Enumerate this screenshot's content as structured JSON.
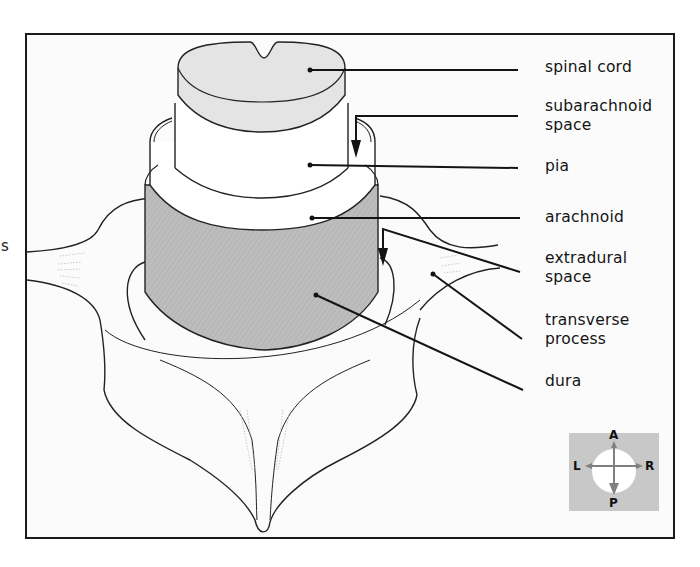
{
  "figure": {
    "type": "anatomical-diagram",
    "edge_fragment": "s"
  },
  "labels": [
    {
      "id": "spinal-cord",
      "text": "spinal cord"
    },
    {
      "id": "subarachnoid-space",
      "text": "subarachnoid\nspace"
    },
    {
      "id": "pia",
      "text": "pia"
    },
    {
      "id": "arachnoid",
      "text": "arachnoid"
    },
    {
      "id": "extradural-space",
      "text": "extradural\nspace"
    },
    {
      "id": "transverse-process",
      "text": "transverse\nprocess"
    },
    {
      "id": "dura",
      "text": "dura"
    }
  ],
  "orientation": {
    "anterior": "A",
    "posterior": "P",
    "left": "L",
    "right": "R"
  },
  "colors": {
    "frame": "#1a1a1a",
    "spinal_cord_fill": "#e4e4e4",
    "dura_fill": "#bdbdbd",
    "compass_bg": "#c8c8c8",
    "compass_arrow": "#808080",
    "line": "#141414"
  }
}
